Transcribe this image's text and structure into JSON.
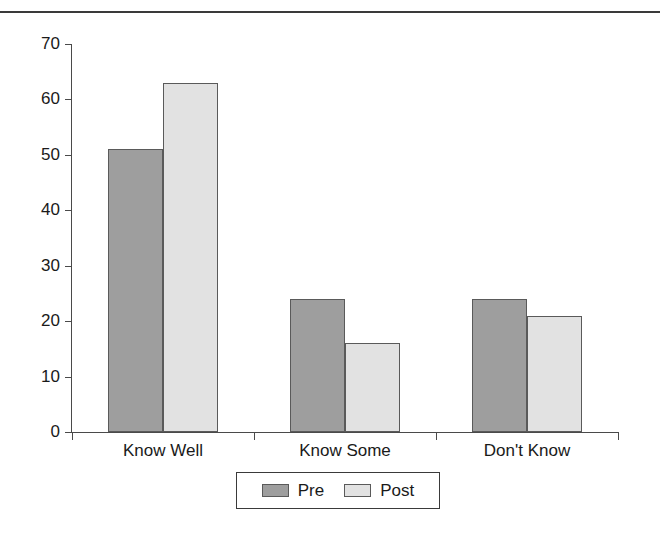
{
  "header": {
    "cut_off_text": ""
  },
  "chart_data": {
    "type": "bar",
    "title": "",
    "xlabel": "",
    "ylabel": "",
    "categories": [
      "Know Well",
      "Know Some",
      "Don't Know"
    ],
    "series": [
      {
        "name": "Pre",
        "color": "#9e9e9e",
        "values": [
          51,
          24,
          24
        ]
      },
      {
        "name": "Post",
        "color": "#e2e2e2",
        "values": [
          63,
          16,
          21
        ]
      }
    ],
    "ylim": [
      0,
      70
    ],
    "yticks": [
      0,
      10,
      20,
      30,
      40,
      50,
      60,
      70
    ],
    "ytick_labels": [
      "0",
      "10",
      "20",
      "30",
      "40",
      "50",
      "60",
      "70"
    ],
    "grid": false,
    "legend_position": "bottom",
    "legend_entries": [
      "Pre",
      "Post"
    ]
  }
}
